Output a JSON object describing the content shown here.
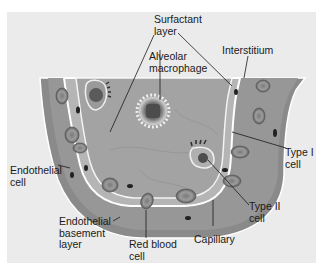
{
  "figure": {
    "background_color": "#ebebeb",
    "tissue_color": "#8c8c8c",
    "alveolar_space_color": "#a3a3a3",
    "cell_membrane_color": "#f4f4f4"
  },
  "labels": {
    "surfactant_layer": "Surfactant\nlayer",
    "interstitium": "Interstitium",
    "alveolar_macrophage": "Alveolar\nmacrophage",
    "type_i_cell": "Type I\ncell",
    "endothelial_cell": "Endothelial\ncell",
    "type_ii_cell": "Type II\ncell",
    "endothelial_basement_layer": "Endothelial\nbasement\nlayer",
    "red_blood_cell": "Red blood\ncell",
    "capillary": "Capillary"
  }
}
